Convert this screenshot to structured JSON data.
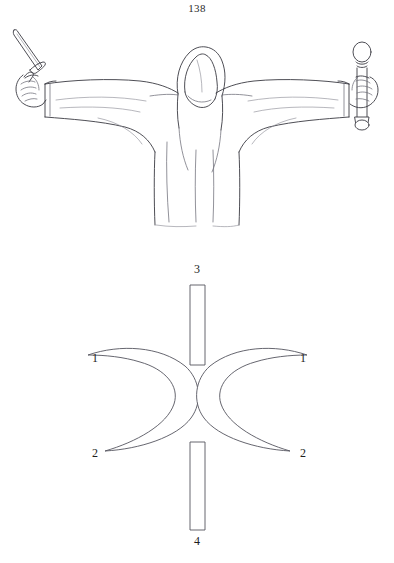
{
  "page": {
    "folio_number": "138",
    "background_color": "#ffffff",
    "ink_color": "#3a3a42",
    "diagram_ink_color": "#55555f"
  },
  "figure_plate": {
    "name": "robed-figure-illustration",
    "description": "Hooded robed figure standing with both arms outstretched horizontally",
    "left_hand_item": "dagger",
    "right_hand_item": "wand",
    "parts": {
      "hood": "hood",
      "face": "shadowed-face",
      "left_arm": "left-sleeve",
      "right_arm": "right-sleeve",
      "robe": "robe-body"
    }
  },
  "symbol_plate": {
    "name": "crescent-and-bar-symbol",
    "description": "Vertical bar crossed by two outward-facing crescents",
    "labels": [
      {
        "id": "left-1",
        "text": "1",
        "position": "left-upper"
      },
      {
        "id": "right-1",
        "text": "1",
        "position": "right-upper"
      },
      {
        "id": "left-2",
        "text": "2",
        "position": "left-lower"
      },
      {
        "id": "right-2",
        "text": "2",
        "position": "right-lower"
      },
      {
        "id": "top-3",
        "text": "3",
        "position": "top"
      },
      {
        "id": "bottom-4",
        "text": "4",
        "position": "bottom"
      }
    ]
  }
}
